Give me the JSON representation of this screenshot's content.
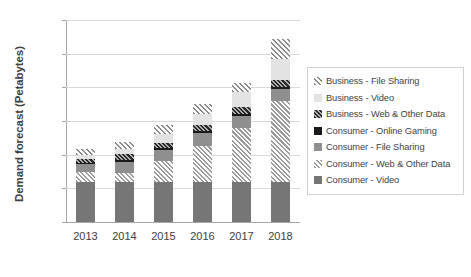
{
  "chart_data": {
    "type": "bar",
    "stacked": true,
    "title": "",
    "xlabel": "",
    "ylabel": "Demand forecast (Petabytes)",
    "categories": [
      "2013",
      "2014",
      "2015",
      "2016",
      "2017",
      "2018"
    ],
    "ylim": [
      0,
      6000
    ],
    "yticks": [
      0,
      1000,
      2000,
      3000,
      4000,
      5000,
      6000
    ],
    "ytick_labels": [
      "0",
      "1,000",
      "2,000",
      "3,000",
      "4,000",
      "5,000",
      "6,000"
    ],
    "grid": true,
    "legend_position": "right",
    "series": [
      {
        "name": "Consumer - Video",
        "color": "#767676",
        "pattern": "solid",
        "values": [
          1200,
          1200,
          1190,
          1190,
          1190,
          1190
        ]
      },
      {
        "name": "Consumer - Web & Other Data",
        "color": "#9c9c9c",
        "pattern": "cross-hatch-light",
        "values": [
          280,
          270,
          620,
          1060,
          1600,
          2410
        ]
      },
      {
        "name": "Consumer - File Sharing",
        "color": "#8f8f8f",
        "pattern": "solid",
        "values": [
          230,
          310,
          330,
          380,
          370,
          360
        ]
      },
      {
        "name": "Consumer - Online Gaming",
        "color": "#1a1a1a",
        "pattern": "solid",
        "values": [
          40,
          50,
          50,
          60,
          60,
          60
        ]
      },
      {
        "name": "Business - Web & Other Data",
        "color": "#262626",
        "pattern": "dense-check",
        "values": [
          130,
          180,
          170,
          180,
          190,
          200
        ]
      },
      {
        "name": "Business - Video",
        "color": "#e3e3e3",
        "pattern": "solid",
        "values": [
          110,
          170,
          270,
          330,
          440,
          610
        ]
      },
      {
        "name": "Business - File Sharing",
        "color": "#8a8a8a",
        "pattern": "diagonal-hatch",
        "values": [
          170,
          200,
          250,
          300,
          270,
          620
        ]
      }
    ],
    "totals": [
      2160,
      2580,
      3080,
      3720,
      4520,
      5450
    ]
  },
  "legend": {
    "items": [
      {
        "label": "Business - File Sharing",
        "swatch": "business-file-sharing-swatch"
      },
      {
        "label": "Business - Video",
        "swatch": "business-video-swatch"
      },
      {
        "label": "Business - Web & Other Data",
        "swatch": "business-web-swatch"
      },
      {
        "label": "Consumer - Online Gaming",
        "swatch": "consumer-gaming-swatch"
      },
      {
        "label": "Consumer - File Sharing",
        "swatch": "consumer-file-sharing-swatch"
      },
      {
        "label": "Consumer - Web & Other Data",
        "swatch": "consumer-web-swatch"
      },
      {
        "label": "Consumer - Video",
        "swatch": "consumer-video-swatch"
      }
    ]
  },
  "axis": {
    "y_title": "Demand forecast (Petabytes)"
  }
}
